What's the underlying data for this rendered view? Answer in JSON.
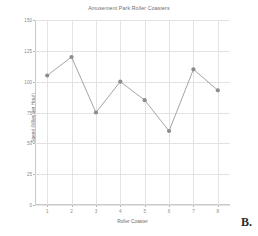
{
  "chart_data": {
    "type": "line",
    "title": "Amusement Park Roller Coasters",
    "xlabel": "Roller Coaster",
    "ylabel": "Speed (Miles per Hour)",
    "categories": [
      "1",
      "2",
      "3",
      "4",
      "5",
      "6",
      "7",
      "8"
    ],
    "x": [
      1,
      2,
      3,
      4,
      5,
      6,
      7,
      8
    ],
    "values": [
      105,
      120,
      75,
      100,
      85,
      60,
      110,
      93
    ],
    "xlim": [
      0.5,
      8.5
    ],
    "ylim": [
      0,
      150
    ],
    "yticks": [
      0,
      25,
      50,
      75,
      100,
      125,
      150
    ],
    "ytick_labels": [
      "0",
      "25",
      "50",
      "75",
      "100",
      "125",
      "150"
    ],
    "xticks": [
      1,
      2,
      3,
      4,
      5,
      6,
      7,
      8
    ],
    "xtick_labels": [
      "1",
      "2",
      "3",
      "4",
      "5",
      "6",
      "7",
      "8"
    ],
    "grid": true,
    "legend": null,
    "marker": "circle",
    "line_color": "#9a9a9a",
    "marker_color": "#8c8c8c",
    "grid_color": "#e3e3e3",
    "axis_color": "#c9c9c9",
    "background_color": "#ffffff"
  },
  "annotation": {
    "panel_label": "B."
  }
}
